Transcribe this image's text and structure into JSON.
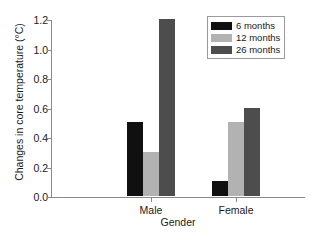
{
  "chart_data": {
    "type": "bar",
    "title": "",
    "xlabel": "Gender",
    "ylabel": "Changes in core temperature (°C)",
    "categories": [
      "Male",
      "Female"
    ],
    "series": [
      {
        "name": "6 months",
        "values": [
          0.5,
          0.1
        ],
        "color": "#101010"
      },
      {
        "name": "12 months",
        "values": [
          0.3,
          0.5
        ],
        "color": "#b2b2b2"
      },
      {
        "name": "26 months",
        "values": [
          1.2,
          0.6
        ],
        "color": "#4d4d4d"
      }
    ],
    "ylim": [
      0.0,
      1.2
    ],
    "yticks": [
      "0.0",
      "0.2",
      "0.4",
      "0.6",
      "0.8",
      "1.0",
      "1.2"
    ],
    "ytick_values": [
      0.0,
      0.2,
      0.4,
      0.6,
      0.8,
      1.0,
      1.2
    ],
    "grid": false,
    "legend_position": "top-right",
    "axis_color": "#8a8a8a"
  }
}
